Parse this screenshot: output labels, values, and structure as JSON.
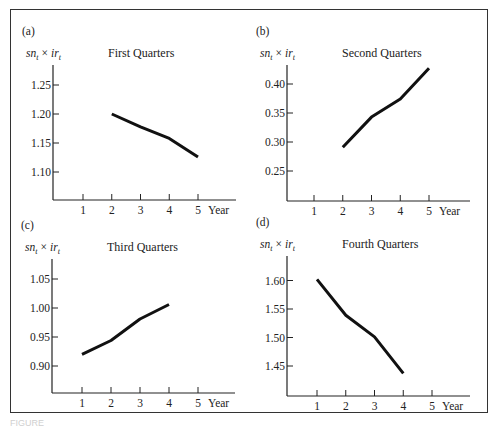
{
  "figure": {
    "panels": [
      {
        "id": "a",
        "label": "(a)",
        "title": "First Quarters"
      },
      {
        "id": "b",
        "label": "(b)",
        "title": "Second Quarters"
      },
      {
        "id": "c",
        "label": "(c)",
        "title": "Third Quarters"
      },
      {
        "id": "d",
        "label": "(d)",
        "title": "Fourth Quarters"
      }
    ],
    "ylabel_main": "sn",
    "ylabel_sub": "t",
    "ylabel_times": "×",
    "ylabel_main2": "ir",
    "ylabel_sub2": "t",
    "xlabel": "Year",
    "caption": "FIGURE"
  },
  "chart_data": [
    {
      "type": "line",
      "title": "(a) First Quarters",
      "xlabel": "Year",
      "ylabel": "sn_t × ir_t",
      "x_ticks": [
        1,
        2,
        3,
        4,
        5
      ],
      "y_ticks": [
        "1.10",
        "1.15",
        "1.20",
        "1.25"
      ],
      "ylim": [
        1.05,
        1.29
      ],
      "x": [
        2,
        3,
        4,
        5
      ],
      "values": [
        1.2,
        1.178,
        1.158,
        1.126
      ],
      "grid": false
    },
    {
      "type": "line",
      "title": "(b) Second Quarters",
      "xlabel": "Year",
      "ylabel": "sn_t × ir_t",
      "x_ticks": [
        1,
        2,
        3,
        4,
        5
      ],
      "y_ticks": [
        "0.25",
        "0.30",
        "0.35",
        "0.40"
      ],
      "ylim": [
        0.2,
        0.44
      ],
      "x": [
        2,
        3,
        4,
        5
      ],
      "values": [
        0.291,
        0.343,
        0.374,
        0.427
      ],
      "grid": false
    },
    {
      "type": "line",
      "title": "(c) Third Quarters",
      "xlabel": "Year",
      "ylabel": "sn_t × ir_t",
      "x_ticks": [
        1,
        2,
        3,
        4,
        5
      ],
      "y_ticks": [
        "0.90",
        "0.95",
        "1.00",
        "1.05"
      ],
      "ylim": [
        0.85,
        1.09
      ],
      "x": [
        1,
        2,
        3,
        4
      ],
      "values": [
        0.92,
        0.944,
        0.981,
        1.006
      ],
      "grid": false
    },
    {
      "type": "line",
      "title": "(d) Fourth Quarters",
      "xlabel": "Year",
      "ylabel": "sn_t × ir_t",
      "x_ticks": [
        1,
        2,
        3,
        4,
        5
      ],
      "y_ticks": [
        "1.45",
        "1.50",
        "1.55",
        "1.60"
      ],
      "ylim": [
        1.4,
        1.64
      ],
      "x": [
        1,
        2,
        3,
        4
      ],
      "values": [
        1.602,
        1.539,
        1.501,
        1.437
      ],
      "grid": false
    }
  ]
}
